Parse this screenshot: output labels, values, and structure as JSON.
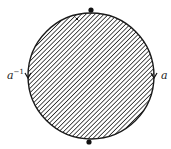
{
  "diagram": {
    "type": "disk-identification",
    "fill_pattern": "diagonal-hatch",
    "colors": {
      "stroke": "#1a1a1a",
      "hatch": "#2a2a2a",
      "background": "#ffffff"
    },
    "circle": {
      "cx": 91,
      "cy": 76,
      "r": 63
    },
    "vertices": [
      {
        "name": "top-vertex",
        "x": 91,
        "y": 10
      },
      {
        "name": "bottom-vertex",
        "x": 89,
        "y": 142
      }
    ],
    "edges": [
      {
        "side": "left",
        "label_base": "a",
        "label_exp": "−1",
        "arrow": "down"
      },
      {
        "side": "right",
        "label_base": "a",
        "label_exp": "",
        "arrow": "down"
      }
    ],
    "point_mark": {
      "label": "x",
      "x": 77,
      "y": 19
    }
  }
}
